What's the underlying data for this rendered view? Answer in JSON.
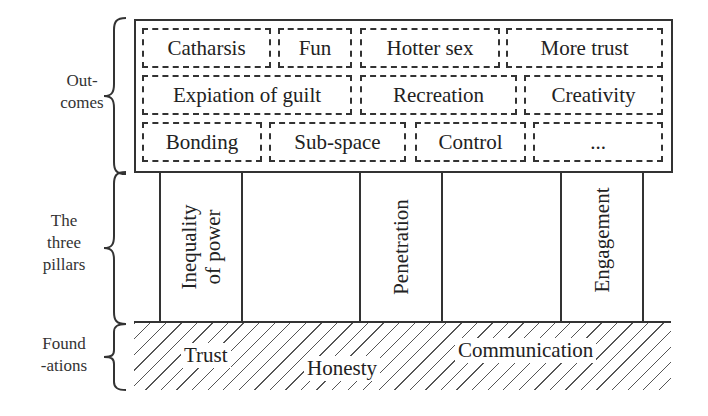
{
  "diagram": {
    "side_labels": {
      "outcomes": "Out-\ncomes",
      "outcomes_line1": "Out-",
      "outcomes_line2": "comes",
      "pillars_line1": "The",
      "pillars_line2": "three",
      "pillars_line3": "pillars",
      "foundations_line1": "Found",
      "foundations_line2": "-ations"
    },
    "outcomes": {
      "rows": [
        [
          "Catharsis",
          "Fun",
          "Hotter sex",
          "More trust"
        ],
        [
          "Expiation of guilt",
          "Recreation",
          "Creativity"
        ],
        [
          "Bonding",
          "Sub-space",
          "Control",
          "..."
        ]
      ]
    },
    "pillars": {
      "items": [
        {
          "line1": "Inequality",
          "line2": "of power"
        },
        {
          "line1": "Penetration",
          "line2": ""
        },
        {
          "line1": "Engagement",
          "line2": ""
        }
      ]
    },
    "foundations": {
      "items": [
        "Trust",
        "Honesty",
        "Communication"
      ]
    },
    "colors": {
      "line": "#333333",
      "background": "#ffffff",
      "hatch": "#555555"
    }
  }
}
